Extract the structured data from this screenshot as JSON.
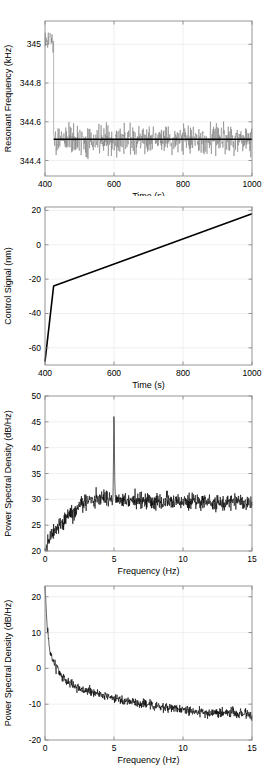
{
  "figure": {
    "name": "four-panel-measurement-figure",
    "background": "#ffffff",
    "trace_gray": "#7d7d7d",
    "trace_black": "#000000",
    "grid_color": "#e9e9e9",
    "axis_color": "#8a8a8a"
  },
  "chart_data": [
    {
      "id": "panel1",
      "type": "line",
      "title": "",
      "xlabel": "Time (s)",
      "ylabel": "Resonant Frequency (kHz)",
      "xlim": [
        400,
        1000
      ],
      "ylim": [
        344.32,
        345.12
      ],
      "xticks": [
        400,
        600,
        800,
        1000
      ],
      "xticklabels": [
        "400",
        "600",
        "800",
        "1000"
      ],
      "yticks": [
        344.4,
        344.6,
        344.8,
        345
      ],
      "yticklabels": [
        "344.4",
        "344.6",
        "344.8",
        "345"
      ],
      "grid": true,
      "legend": "none",
      "series": [
        {
          "name": "resonant-frequency-noise",
          "color": "#7d7d7d",
          "style": "noise-band",
          "description": "High frequency noisy signal: large amplitude transient between 400 and 425 s centred near 345.02 kHz, then settles into a steady band centred at 344.51 kHz",
          "segments": [
            {
              "x_start": 400,
              "x_end": 425,
              "center": 345.02,
              "spread": 0.085
            },
            {
              "x_start": 425,
              "x_end": 1000,
              "center": 344.51,
              "spread": 0.105
            }
          ]
        },
        {
          "name": "mean-reference-line",
          "color": "#000000",
          "style": "solid",
          "description": "Horizontal black mean line",
          "x": [
            425,
            1000
          ],
          "y": [
            344.51,
            344.51
          ]
        }
      ]
    },
    {
      "id": "panel2",
      "type": "line",
      "title": "",
      "xlabel": "Time (s)",
      "ylabel": "Control Signal (nm)",
      "xlim": [
        400,
        1000
      ],
      "ylim": [
        -70,
        22
      ],
      "xticks": [
        400,
        600,
        800,
        1000
      ],
      "xticklabels": [
        "400",
        "600",
        "800",
        "1000"
      ],
      "yticks": [
        -60,
        -40,
        -20,
        0,
        20
      ],
      "yticklabels": [
        "-60",
        "-40",
        "-20",
        "0",
        "20"
      ],
      "grid": true,
      "legend": "none",
      "series": [
        {
          "name": "control-signal",
          "color": "#000000",
          "style": "solid",
          "description": "Steep rise from -68 nm at 400 s to -24 nm at 425 s, then linear ramp up to 18 nm at 1000 s",
          "x": [
            400,
            425,
            1000
          ],
          "y": [
            -68,
            -24,
            18
          ]
        }
      ]
    },
    {
      "id": "panel3",
      "type": "line",
      "title": "",
      "xlabel": "Frequency (Hz)",
      "ylabel": "Power Spectral Density (dB/Hz)",
      "xlim": [
        0,
        15
      ],
      "ylim": [
        20,
        50
      ],
      "xticks": [
        0,
        5,
        10,
        15
      ],
      "xticklabels": [
        "0",
        "5",
        "10",
        "15"
      ],
      "yticks": [
        20,
        25,
        30,
        35,
        40,
        45,
        50
      ],
      "yticklabels": [
        "20",
        "25",
        "30",
        "35",
        "40",
        "45",
        "50"
      ],
      "grid": true,
      "legend": "none",
      "annotations": [
        {
          "name": "tonal-peak",
          "x": 5,
          "y": 47.7,
          "label": ""
        }
      ],
      "series": [
        {
          "name": "psd-closed-loop",
          "color": "#000000",
          "style": "noise-spectrum",
          "description": "Noise floor rising from about 20 dB/Hz at DC to a 30 dB/Hz plateau by 3 Hz, flat near 29-30 dB/Hz out to 15 Hz, with a narrow tonal spike at 5 Hz reaching 47.7 dB/Hz",
          "baseline_points": [
            {
              "x": 0,
              "y": 20.2
            },
            {
              "x": 0.3,
              "y": 22.5
            },
            {
              "x": 1,
              "y": 25.0
            },
            {
              "x": 2,
              "y": 27.6
            },
            {
              "x": 3,
              "y": 29.6
            },
            {
              "x": 4,
              "y": 30.4
            },
            {
              "x": 5,
              "y": 30.2
            },
            {
              "x": 7,
              "y": 29.6
            },
            {
              "x": 9,
              "y": 29.5
            },
            {
              "x": 11,
              "y": 29.4
            },
            {
              "x": 13,
              "y": 29.6
            },
            {
              "x": 15,
              "y": 29.3
            }
          ],
          "noise_spread": 2.4,
          "peak": {
            "x": 5.0,
            "y": 47.7,
            "width_hz": 0.07
          }
        }
      ]
    },
    {
      "id": "panel4",
      "type": "line",
      "title": "",
      "xlabel": "Frequency (Hz)",
      "ylabel": "Power Spectral Density (dB/Hz)",
      "xlim": [
        0,
        15
      ],
      "ylim": [
        -20,
        23
      ],
      "xticks": [
        0,
        5,
        10,
        15
      ],
      "xticklabels": [
        "0",
        "5",
        "10",
        "15"
      ],
      "yticks": [
        -20,
        -10,
        0,
        10,
        20
      ],
      "yticklabels": [
        "-20",
        "-10",
        "0",
        "10",
        "20"
      ],
      "grid": true,
      "legend": "none",
      "series": [
        {
          "name": "psd-open-loop",
          "color": "#000000",
          "style": "noise-spectrum",
          "description": "One-over-f style decay from 23 dB/Hz at DC falling steeply to 0 dB/Hz near 1 Hz, then gradually to about -13 dB/Hz by 15 Hz",
          "baseline_points": [
            {
              "x": 0,
              "y": 23.0
            },
            {
              "x": 0.15,
              "y": 12.0
            },
            {
              "x": 0.35,
              "y": 5.0
            },
            {
              "x": 0.7,
              "y": 1.0
            },
            {
              "x": 1.2,
              "y": -2.0
            },
            {
              "x": 2,
              "y": -4.6
            },
            {
              "x": 3,
              "y": -6.2
            },
            {
              "x": 4,
              "y": -7.2
            },
            {
              "x": 5,
              "y": -8.4
            },
            {
              "x": 6.5,
              "y": -9.6
            },
            {
              "x": 8,
              "y": -10.4
            },
            {
              "x": 10,
              "y": -11.6
            },
            {
              "x": 12,
              "y": -12.6
            },
            {
              "x": 13.5,
              "y": -12.4
            },
            {
              "x": 15,
              "y": -13.2
            }
          ],
          "noise_spread": 2.0
        }
      ]
    }
  ]
}
